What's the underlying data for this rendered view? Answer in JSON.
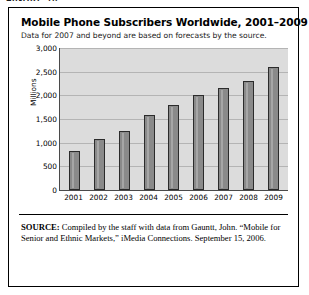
{
  "figure_label": "FIGURE 10",
  "chart_data": {
    "type": "bar",
    "title": "Mobile Phone Subscribers Worldwide, 2001–2009",
    "subtitle": "Data for 2007 and beyond are based on forecasts by the source.",
    "xlabel": "",
    "ylabel": "Millions",
    "categories": [
      "2001",
      "2002",
      "2003",
      "2004",
      "2005",
      "2006",
      "2007",
      "2008",
      "2009"
    ],
    "values": [
      820,
      1080,
      1250,
      1580,
      1800,
      2000,
      2150,
      2300,
      2600
    ],
    "ylim": [
      0,
      3000
    ],
    "yticks": [
      "0",
      "500",
      "1,000",
      "1,500",
      "2,000",
      "2,500",
      "3,000"
    ],
    "ytick_values": [
      0,
      500,
      1000,
      1500,
      2000,
      2500,
      3000
    ],
    "grid": true,
    "legend": "none",
    "bar_color": "#8a8a8a",
    "bar_edge_color": "#2b2b2b",
    "plot_background": "#dcdcdc",
    "gridline_color": "#b4b4b4"
  },
  "source_note": {
    "label": "SOURCE:",
    "text": " Compiled by the staff with data from Gauntt, John. “Mobile for Senior and Ethnic Markets,” iMedia Connections. September 15, 2006."
  }
}
